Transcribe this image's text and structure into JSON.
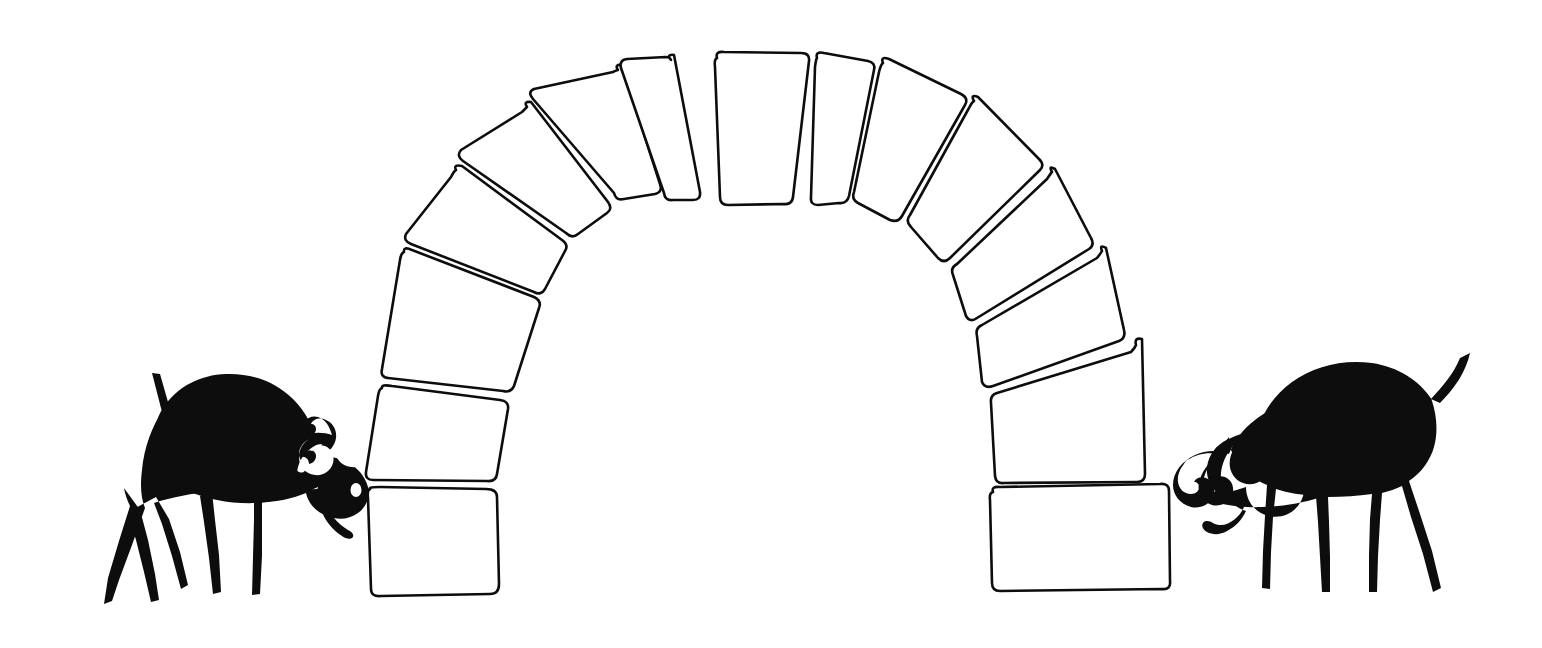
{
  "artwork": {
    "title": "Arch of voussoir blocks flanked by two facing horned animals",
    "medium": "line drawing / silhouette illustration",
    "background_color": "#ffffff",
    "ink_color": "#0d0d0d",
    "canvas": {
      "width": 1542,
      "height": 648
    }
  },
  "arch": {
    "name": "masonry-arch",
    "description": "Hand-drawn semicircular arch built from separated trapezoidal voussoir stones with rounded corners",
    "block_count": 14,
    "keystone_index": 7,
    "stroke_color": "#0d0d0d",
    "fill_color": "#ffffff",
    "stroke_width": 2.6,
    "blocks": [
      {
        "id": "block-l1",
        "side": "left",
        "label": "springer",
        "points": "368,487 494,490 498,592 372,597"
      },
      {
        "id": "block-l2",
        "side": "left",
        "label": "voussoir",
        "points": "380,386 508,399 497,481 366,480"
      },
      {
        "id": "block-l3",
        "side": "left",
        "label": "voussoir",
        "points": "400,248 540,297 512,393 381,380"
      },
      {
        "id": "block-l4",
        "side": "left",
        "label": "voussoir",
        "points": "451,166 567,242 546,293 404,243"
      },
      {
        "id": "block-l5",
        "side": "left",
        "label": "voussoir",
        "points": "522,103 613,203 573,238 456,161"
      },
      {
        "id": "block-l6",
        "side": "left",
        "label": "voussoir",
        "points": "614,67 664,186 619,200 528,99"
      },
      {
        "id": "block-l7",
        "side": "left",
        "label": "voussoir",
        "points": "667,56 703,197 668,200 618,63"
      },
      {
        "id": "block-k",
        "side": "center",
        "label": "keystone",
        "points": "714,50 809,52 791,205 722,205"
      },
      {
        "id": "block-r7",
        "side": "right",
        "label": "voussoir",
        "points": "818,52 874,60 846,203 811,206"
      },
      {
        "id": "block-r6",
        "side": "right",
        "label": "voussoir",
        "points": "880,58 966,92 900,220 852,204"
      },
      {
        "id": "block-r5",
        "side": "right",
        "label": "voussoir",
        "points": "972,95 1044,160 946,262 905,224"
      },
      {
        "id": "block-r4",
        "side": "right",
        "label": "voussoir",
        "points": "1050,166 1095,240 971,322 949,268"
      },
      {
        "id": "block-r3",
        "side": "right",
        "label": "voussoir",
        "points": "1100,245 1128,333 988,390 975,327"
      },
      {
        "id": "block-r2",
        "side": "right",
        "label": "voussoir",
        "points": "1134,339 1148,482 995,484 991,395"
      },
      {
        "id": "block-r1",
        "side": "right",
        "label": "springer",
        "points": "989,491 1168,486 1172,589 991,592"
      }
    ]
  },
  "figures": [
    {
      "id": "left-animal",
      "name": "left-horned-animal",
      "species": "horned ram / ibex silhouette",
      "facing": "right",
      "fill_color": "#0d0d0d",
      "eye_color": "#ffffff",
      "horns": 2,
      "legs": 4,
      "tail": "short upright spike",
      "bbox": {
        "x": 84,
        "y": 372,
        "width": 295,
        "height": 236
      }
    },
    {
      "id": "right-animal",
      "name": "right-horned-animal",
      "species": "horned ram / ibex silhouette",
      "facing": "left",
      "fill_color": "#0d0d0d",
      "eye_color": "#ffffff",
      "horns": 2,
      "legs": 4,
      "tail": "upturned curling tail",
      "bbox": {
        "x": 1176,
        "y": 352,
        "width": 295,
        "height": 246
      }
    }
  ]
}
